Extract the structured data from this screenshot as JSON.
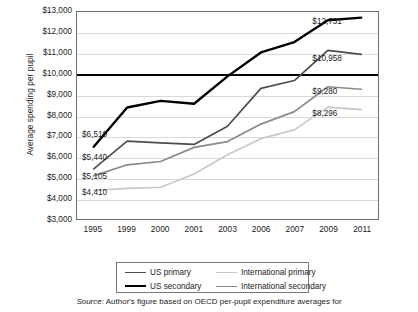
{
  "chart_data": {
    "type": "line",
    "title": "",
    "xlabel": "",
    "ylabel": "Average spending per pupil",
    "categories": [
      "1995",
      "1999",
      "2000",
      "2001",
      "2003",
      "2006",
      "2007",
      "2009",
      "2011"
    ],
    "ylim": [
      3000,
      13000
    ],
    "ytick_values": [
      3000,
      4000,
      5000,
      6000,
      7000,
      8000,
      9000,
      10000,
      11000,
      12000,
      13000
    ],
    "ytick_labels": [
      "$3,000",
      "$4,000",
      "$5,000",
      "$6,000",
      "$7,000",
      "$8,000",
      "$9,000",
      "$10,000",
      "$11,000",
      "$12,000",
      "$13,000"
    ],
    "grid": true,
    "reference_line": {
      "value": 10000,
      "label": "$10,000",
      "style": "bold-black"
    },
    "legend_position": "bottom",
    "series": [
      {
        "name": "US primary",
        "color": "#4d4d4d",
        "values": [
          5440,
          6780,
          6700,
          6620,
          7500,
          9320,
          9700,
          11150,
          10958
        ],
        "start_label": "$5,440",
        "end_label": "$10,958"
      },
      {
        "name": "US secondary",
        "color": "#000000",
        "values": [
          6510,
          8400,
          8720,
          8580,
          9900,
          11050,
          11550,
          12600,
          12731
        ],
        "start_label": "$6,510",
        "end_label": "$12,731"
      },
      {
        "name": "International primary",
        "color": "#c8c8c8",
        "values": [
          4410,
          4500,
          4560,
          5200,
          6120,
          6900,
          7320,
          8420,
          8296
        ],
        "start_label": "$4,410",
        "end_label": "$8,296"
      },
      {
        "name": "International secondary",
        "color": "#8a8a8a",
        "values": [
          5105,
          5640,
          5800,
          6480,
          6760,
          7600,
          8200,
          9400,
          9280
        ],
        "start_label": "$5,105",
        "end_label": "$9,280"
      }
    ],
    "value_labels": [
      {
        "text": "$6,510",
        "series": "US secondary",
        "x_pct": 2.0,
        "y_value": 7080
      },
      {
        "text": "$5,440",
        "series": "US primary",
        "x_pct": 2.0,
        "y_value": 5960
      },
      {
        "text": "$5,105",
        "series": "International secondary",
        "x_pct": 2.0,
        "y_value": 5060
      },
      {
        "text": "$4,410",
        "series": "International primary",
        "x_pct": 2.0,
        "y_value": 4300
      },
      {
        "text": "$12,731",
        "series": "US secondary",
        "x_pct": 78.0,
        "y_value": 12450
      },
      {
        "text": "$10,958",
        "series": "US primary",
        "x_pct": 78.0,
        "y_value": 10680
      },
      {
        "text": "$9,280",
        "series": "International secondary",
        "x_pct": 78.0,
        "y_value": 9140
      },
      {
        "text": "$8,296",
        "series": "International primary",
        "x_pct": 78.0,
        "y_value": 8060
      }
    ]
  },
  "legend": {
    "entries": [
      {
        "label": "US primary",
        "color": "#4d4d4d",
        "width": "1.6px"
      },
      {
        "label": "International primary",
        "color": "#c8c8c8",
        "width": "1.6px"
      },
      {
        "label": "US secondary",
        "color": "#000000",
        "width": "2.4px"
      },
      {
        "label": "International secondary",
        "color": "#8a8a8a",
        "width": "1.6px"
      }
    ]
  },
  "source": {
    "keyword": "Source:",
    "text": " Author's figure based on OECD per-pupil expenditure averages for"
  }
}
